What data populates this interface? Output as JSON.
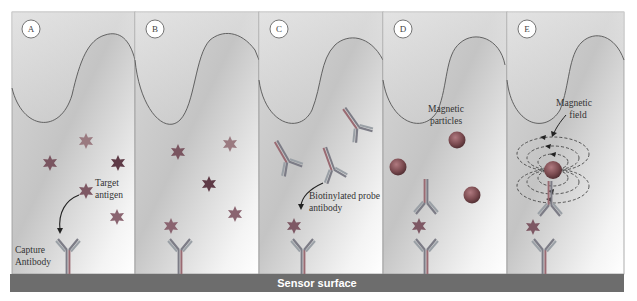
{
  "figure": {
    "panels": [
      {
        "id": "A",
        "labels": [
          "Target antigen",
          "Capture Antibody"
        ]
      },
      {
        "id": "B",
        "labels": []
      },
      {
        "id": "C",
        "labels": [
          "Biotinylated probe antibody"
        ]
      },
      {
        "id": "D",
        "labels": [
          "Magnetic particles"
        ]
      },
      {
        "id": "E",
        "labels": [
          "Magnetic field"
        ]
      }
    ],
    "text": {
      "a_target_line1": "Target",
      "a_target_line2": "antigen",
      "a_capture_line1": "Capture",
      "a_capture_line2": "Antibody",
      "c_probe_line1": "Biotinylated probe",
      "c_probe_line2": "antibody",
      "d_particles_line1": "Magnetic",
      "d_particles_line2": "particles",
      "e_field_line1": "Magnetic",
      "e_field_line2": "field",
      "sensor_surface": "Sensor surface"
    },
    "colors": {
      "antigen": "#8a5a66",
      "antigen_dark": "#6e3f4c",
      "antibody": "#7a7a86",
      "particle": "#7a4a4f",
      "surface": "#6b6b6b",
      "wave_line": "#555555"
    }
  }
}
